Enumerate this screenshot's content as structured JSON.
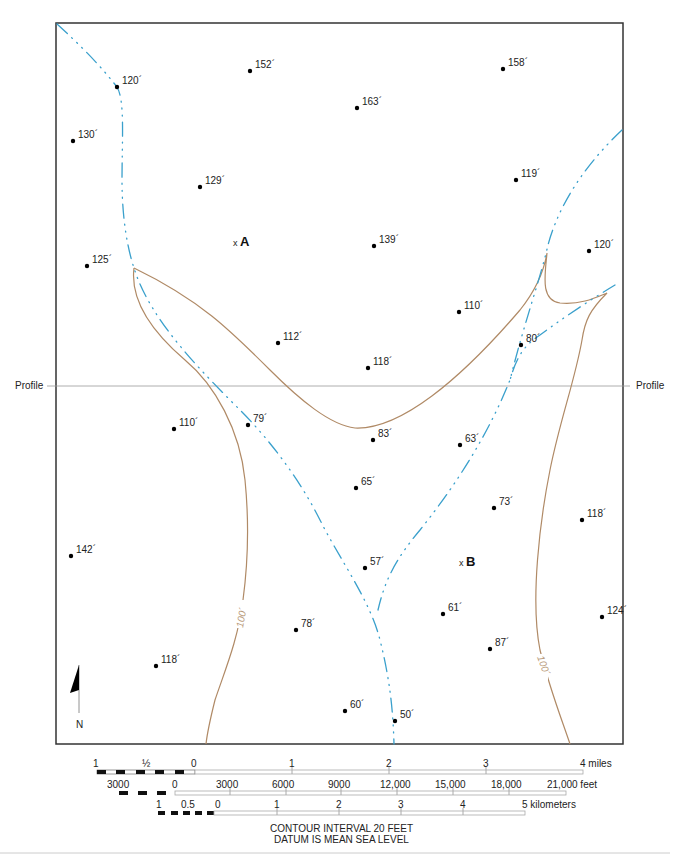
{
  "map": {
    "colors": {
      "frame": "#333333",
      "stream": "#3aa0cc",
      "contour": "#b08a66",
      "profile_line": "#999999",
      "point": "#000000"
    },
    "profile": {
      "left_label": "Profile",
      "right_label": "Profile"
    },
    "points": [
      {
        "x": 117,
        "y": 87,
        "label": "120´"
      },
      {
        "x": 250,
        "y": 71,
        "label": "152´"
      },
      {
        "x": 503,
        "y": 69,
        "label": "158´"
      },
      {
        "x": 357,
        "y": 108,
        "label": "163´"
      },
      {
        "x": 73,
        "y": 141,
        "label": "130´"
      },
      {
        "x": 200,
        "y": 187,
        "label": "129´"
      },
      {
        "x": 516,
        "y": 180,
        "label": "119´"
      },
      {
        "x": 374,
        "y": 246,
        "label": "139´"
      },
      {
        "x": 589,
        "y": 251,
        "label": "120´"
      },
      {
        "x": 87,
        "y": 266,
        "label": "125´"
      },
      {
        "x": 459,
        "y": 312,
        "label": "110´"
      },
      {
        "x": 278,
        "y": 343,
        "label": "112´"
      },
      {
        "x": 521,
        "y": 345,
        "label": "80´"
      },
      {
        "x": 368,
        "y": 368,
        "label": "118´"
      },
      {
        "x": 174,
        "y": 429,
        "label": "110´"
      },
      {
        "x": 248,
        "y": 425,
        "label": "79´"
      },
      {
        "x": 373,
        "y": 440,
        "label": "83´"
      },
      {
        "x": 460,
        "y": 445,
        "label": "63´"
      },
      {
        "x": 356,
        "y": 488,
        "label": "65´"
      },
      {
        "x": 494,
        "y": 508,
        "label": "73´"
      },
      {
        "x": 582,
        "y": 520,
        "label": "118´"
      },
      {
        "x": 71,
        "y": 556,
        "label": "142´"
      },
      {
        "x": 365,
        "y": 568,
        "label": "57´"
      },
      {
        "x": 443,
        "y": 614,
        "label": "61´"
      },
      {
        "x": 602,
        "y": 617,
        "label": "124´"
      },
      {
        "x": 296,
        "y": 630,
        "label": "78´"
      },
      {
        "x": 490,
        "y": 649,
        "label": "87´"
      },
      {
        "x": 156,
        "y": 666,
        "label": "118´"
      },
      {
        "x": 345,
        "y": 711,
        "label": "60´"
      },
      {
        "x": 395,
        "y": 721,
        "label": "50´"
      }
    ],
    "locations": [
      {
        "x": 236,
        "y": 244,
        "mark": "x",
        "label": "A"
      },
      {
        "x": 462,
        "y": 564,
        "mark": "x",
        "label": "B"
      }
    ],
    "contours": [
      {
        "label": "100´",
        "x": 240,
        "y": 617,
        "rotate": -80
      },
      {
        "label": "100´",
        "x": 540,
        "y": 667,
        "rotate": 70
      }
    ],
    "north_arrow": {
      "label": "N"
    }
  },
  "scales": {
    "miles": {
      "ticks": [
        "1",
        "½",
        "0",
        "1",
        "2",
        "3"
      ],
      "end_label": "4 miles"
    },
    "feet": {
      "ticks": [
        "3000",
        "0",
        "3000",
        "6000",
        "9000",
        "12,000",
        "15,000",
        "18,000"
      ],
      "end_label": "21,000 feet"
    },
    "kilometers": {
      "ticks": [
        "1",
        "0.5",
        "0",
        "1",
        "2",
        "3",
        "4"
      ],
      "end_label": "5 kilometers"
    }
  },
  "footer": {
    "line1": "CONTOUR INTERVAL 20 FEET",
    "line2": "DATUM IS MEAN SEA LEVEL"
  }
}
